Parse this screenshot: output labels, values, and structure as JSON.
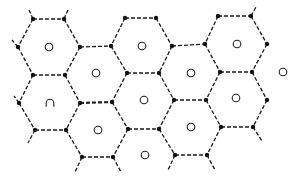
{
  "diagram": {
    "title": "",
    "colors": {
      "line": "#1a1a1a",
      "vertex": "#111111",
      "site": "#222222",
      "background": "#ffffff"
    },
    "vertices": [
      [
        33,
        19
      ],
      [
        64,
        19
      ],
      [
        125,
        18
      ],
      [
        156,
        18
      ],
      [
        218,
        16
      ],
      [
        251,
        16
      ],
      [
        18,
        47
      ],
      [
        80,
        47
      ],
      [
        111,
        46
      ],
      [
        172,
        46
      ],
      [
        205,
        44
      ],
      [
        267,
        44
      ],
      [
        33,
        75
      ],
      [
        65,
        75
      ],
      [
        127,
        73
      ],
      [
        159,
        73
      ],
      [
        220,
        72
      ],
      [
        252,
        72
      ],
      [
        19,
        103
      ],
      [
        80,
        103
      ],
      [
        112,
        102
      ],
      [
        174,
        100
      ],
      [
        206,
        100
      ],
      [
        267,
        100
      ],
      [
        35,
        130
      ],
      [
        66,
        130
      ],
      [
        128,
        129
      ],
      [
        159,
        129
      ],
      [
        221,
        127
      ],
      [
        253,
        127
      ],
      [
        82,
        157
      ],
      [
        113,
        157
      ],
      [
        175,
        155
      ],
      [
        207,
        155
      ]
    ],
    "edges": [
      [
        [
          33,
          19
        ],
        [
          64,
          19
        ]
      ],
      [
        [
          125,
          18
        ],
        [
          156,
          18
        ]
      ],
      [
        [
          218,
          16
        ],
        [
          251,
          16
        ]
      ],
      [
        [
          33,
          19
        ],
        [
          18,
          47
        ]
      ],
      [
        [
          64,
          19
        ],
        [
          80,
          47
        ]
      ],
      [
        [
          125,
          18
        ],
        [
          111,
          46
        ]
      ],
      [
        [
          156,
          18
        ],
        [
          172,
          46
        ]
      ],
      [
        [
          218,
          16
        ],
        [
          205,
          44
        ]
      ],
      [
        [
          251,
          16
        ],
        [
          267,
          44
        ]
      ],
      [
        [
          80,
          47
        ],
        [
          111,
          46
        ]
      ],
      [
        [
          172,
          46
        ],
        [
          205,
          44
        ]
      ],
      [
        [
          18,
          47
        ],
        [
          33,
          75
        ]
      ],
      [
        [
          80,
          47
        ],
        [
          65,
          75
        ]
      ],
      [
        [
          111,
          46
        ],
        [
          127,
          73
        ]
      ],
      [
        [
          172,
          46
        ],
        [
          159,
          73
        ]
      ],
      [
        [
          205,
          44
        ],
        [
          220,
          72
        ]
      ],
      [
        [
          267,
          44
        ],
        [
          252,
          72
        ]
      ],
      [
        [
          33,
          75
        ],
        [
          65,
          75
        ]
      ],
      [
        [
          127,
          73
        ],
        [
          159,
          73
        ]
      ],
      [
        [
          220,
          72
        ],
        [
          252,
          72
        ]
      ],
      [
        [
          33,
          75
        ],
        [
          19,
          103
        ]
      ],
      [
        [
          65,
          75
        ],
        [
          80,
          103
        ]
      ],
      [
        [
          127,
          73
        ],
        [
          112,
          102
        ]
      ],
      [
        [
          159,
          73
        ],
        [
          174,
          100
        ]
      ],
      [
        [
          220,
          72
        ],
        [
          206,
          100
        ]
      ],
      [
        [
          252,
          72
        ],
        [
          267,
          100
        ]
      ],
      [
        [
          174,
          100
        ],
        [
          206,
          100
        ]
      ],
      [
        [
          19,
          103
        ],
        [
          35,
          130
        ]
      ],
      [
        [
          80,
          103
        ],
        [
          66,
          130
        ]
      ],
      [
        [
          112,
          102
        ],
        [
          128,
          129
        ]
      ],
      [
        [
          174,
          100
        ],
        [
          159,
          129
        ]
      ],
      [
        [
          206,
          100
        ],
        [
          221,
          127
        ]
      ],
      [
        [
          267,
          100
        ],
        [
          253,
          127
        ]
      ],
      [
        [
          35,
          130
        ],
        [
          66,
          130
        ]
      ],
      [
        [
          128,
          129
        ],
        [
          159,
          129
        ]
      ],
      [
        [
          221,
          127
        ],
        [
          253,
          127
        ]
      ],
      [
        [
          66,
          130
        ],
        [
          82,
          157
        ]
      ],
      [
        [
          128,
          129
        ],
        [
          113,
          157
        ]
      ],
      [
        [
          159,
          129
        ],
        [
          175,
          155
        ]
      ],
      [
        [
          221,
          127
        ],
        [
          207,
          155
        ]
      ],
      [
        [
          82,
          157
        ],
        [
          113,
          157
        ]
      ],
      [
        [
          175,
          155
        ],
        [
          207,
          155
        ]
      ]
    ],
    "bold_edges": [
      [
        [
          80,
          103
        ],
        [
          112,
          102
        ]
      ]
    ],
    "stubs": [
      [
        [
          33,
          19
        ],
        [
          29,
          10
        ]
      ],
      [
        [
          64,
          19
        ],
        [
          68,
          10
        ]
      ],
      [
        [
          251,
          16
        ],
        [
          256,
          7
        ]
      ],
      [
        [
          18,
          47
        ],
        [
          12,
          40
        ]
      ],
      [
        [
          19,
          103
        ],
        [
          14,
          96
        ]
      ],
      [
        [
          35,
          130
        ],
        [
          28,
          143
        ]
      ],
      [
        [
          253,
          127
        ],
        [
          262,
          141
        ]
      ],
      [
        [
          82,
          157
        ],
        [
          75,
          172
        ]
      ],
      [
        [
          113,
          157
        ],
        [
          121,
          172
        ]
      ],
      [
        [
          175,
          155
        ],
        [
          168,
          170
        ]
      ],
      [
        [
          207,
          155
        ],
        [
          215,
          170
        ]
      ]
    ],
    "sites": [
      {
        "x": 49,
        "y": 47,
        "shape": "circle"
      },
      {
        "x": 142,
        "y": 46,
        "shape": "circle"
      },
      {
        "x": 237,
        "y": 44,
        "shape": "circle"
      },
      {
        "x": 96,
        "y": 73,
        "shape": "circle"
      },
      {
        "x": 191,
        "y": 73,
        "shape": "circle"
      },
      {
        "x": 283,
        "y": 72,
        "shape": "circle"
      },
      {
        "x": 50,
        "y": 103,
        "shape": "arch"
      },
      {
        "x": 144,
        "y": 100,
        "shape": "circle"
      },
      {
        "x": 236,
        "y": 98,
        "shape": "circle"
      },
      {
        "x": 98,
        "y": 130,
        "shape": "circle"
      },
      {
        "x": 191,
        "y": 127,
        "shape": "circle"
      },
      {
        "x": 145,
        "y": 155,
        "shape": "circle"
      }
    ],
    "site_radius": 3.8,
    "vertex_radius": 2.2
  }
}
